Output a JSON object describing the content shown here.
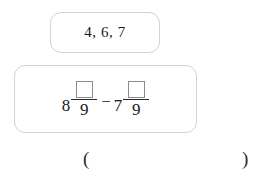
{
  "page": {
    "background_color": "#ffffff",
    "text_color": "#1a1a1a",
    "panel_border_color": "#d2d2d2",
    "blank_border_color": "#8c8c8c"
  },
  "choices_panel": {
    "name": "answer-choices",
    "text": "4, 6, 7"
  },
  "expression_panel": {
    "name": "subtraction-expression",
    "terms": [
      {
        "whole": "8",
        "numerator": "",
        "denominator": "9"
      },
      {
        "whole": "7",
        "numerator": "",
        "denominator": "9"
      }
    ],
    "operator": "−"
  },
  "answer_row": {
    "open_paren": "(",
    "close_paren": ")",
    "answer_value": ""
  }
}
